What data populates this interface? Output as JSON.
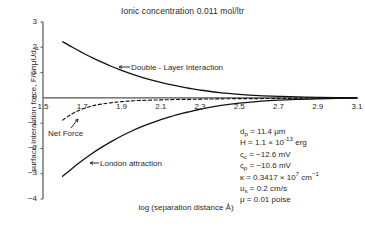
{
  "chart_data": {
    "type": "line",
    "title": "Ionic concentration 0.011 mol/ltr",
    "xlabel": "log (separation distance Å)",
    "ylabel": "surface interaction force, F/6πμUdₚ",
    "xlim": [
      1.5,
      3.1
    ],
    "ylim": [
      -4,
      3
    ],
    "xticks": [
      "1.5",
      "1.7",
      "1.9",
      "2.1",
      "2.3",
      "2.5",
      "2.7",
      "2.9",
      "3.1"
    ],
    "yticks": [
      "3",
      "2",
      "1",
      "0",
      "-1",
      "-2",
      "-3",
      "-4"
    ],
    "grid": false,
    "legend_position": "inline-annotations",
    "series": [
      {
        "name": "Double - Layer Interaction",
        "style": "solid",
        "x": [
          1.6,
          1.65,
          1.7,
          1.75,
          1.8,
          1.85,
          1.9,
          1.95,
          2.0,
          2.05,
          2.1,
          2.15,
          2.2,
          2.25,
          2.3,
          2.4,
          2.5,
          2.6,
          2.7,
          2.8,
          2.9,
          3.0,
          3.1
        ],
        "values": [
          2.22,
          2.0,
          1.79,
          1.59,
          1.41,
          1.24,
          1.09,
          0.95,
          0.82,
          0.71,
          0.61,
          0.52,
          0.44,
          0.37,
          0.31,
          0.21,
          0.14,
          0.09,
          0.06,
          0.04,
          0.02,
          0.01,
          0.01
        ]
      },
      {
        "name": "London attraction",
        "style": "solid",
        "x": [
          1.6,
          1.65,
          1.7,
          1.75,
          1.8,
          1.85,
          1.9,
          1.95,
          2.0,
          2.05,
          2.1,
          2.15,
          2.2,
          2.25,
          2.3,
          2.4,
          2.5,
          2.6,
          2.7,
          2.8,
          2.9,
          3.0,
          3.1
        ],
        "values": [
          -3.1,
          -2.78,
          -2.48,
          -2.2,
          -1.95,
          -1.72,
          -1.51,
          -1.32,
          -1.15,
          -1.0,
          -0.86,
          -0.74,
          -0.63,
          -0.54,
          -0.45,
          -0.31,
          -0.21,
          -0.14,
          -0.09,
          -0.06,
          -0.04,
          -0.02,
          -0.01
        ]
      },
      {
        "name": "Net Force",
        "style": "dashed",
        "x": [
          1.6,
          1.63,
          1.66,
          1.7,
          1.74,
          1.78,
          1.82,
          1.86,
          1.9,
          1.95,
          2.0,
          2.05,
          2.1,
          2.15,
          2.2,
          2.25,
          2.3,
          2.4,
          2.5,
          2.6,
          2.7,
          2.8,
          2.9,
          3.0,
          3.1
        ],
        "values": [
          -0.88,
          -0.72,
          -0.58,
          -0.44,
          -0.34,
          -0.27,
          -0.22,
          -0.18,
          -0.15,
          -0.12,
          -0.1,
          -0.09,
          -0.08,
          -0.07,
          -0.06,
          -0.06,
          -0.05,
          -0.04,
          -0.03,
          -0.03,
          -0.02,
          -0.02,
          -0.01,
          -0.01,
          -0.01
        ]
      }
    ],
    "annotations": [
      {
        "name": "double-layer-interaction",
        "text": "Double - Layer Interaction",
        "arrow": "left"
      },
      {
        "name": "net-force",
        "text": "Net Force",
        "arrow": "up-right"
      },
      {
        "name": "london-attraction",
        "text": "London attraction",
        "arrow": "left"
      }
    ]
  },
  "params": {
    "lines": [
      {
        "symbol": "d",
        "sub": "p",
        "rest": " = 11.4 μm"
      },
      {
        "symbol": "H",
        "sub": "",
        "rest": " = 1.1 × 10",
        "sup": "-13",
        "tail": " erg"
      },
      {
        "symbol": "ς",
        "sub": "c",
        "rest": " = −12.6 mV"
      },
      {
        "symbol": "ς",
        "sub": "p",
        "rest": " = −10.6 mV"
      },
      {
        "symbol": "κ",
        "sub": "",
        "rest": " = 0.3417 × 10",
        "sup": "7",
        "tail": " cm",
        "sup2": "−1"
      },
      {
        "symbol": "u",
        "sub": "s",
        "rest": " = 0.2 cm/s"
      },
      {
        "symbol": "μ",
        "sub": "",
        "rest": " = 0.01 poise"
      }
    ]
  },
  "colors": {
    "ink": "#1a1a1a",
    "axis": "#555555",
    "curve": "#111111"
  }
}
